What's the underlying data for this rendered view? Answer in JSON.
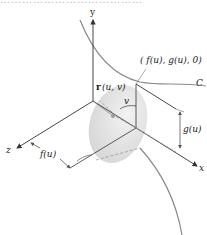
{
  "diagram": {
    "cropped_top_text": "…………………………………",
    "axes": {
      "x": "x",
      "y": "y",
      "z": "z"
    },
    "labels": {
      "point": "( f(u), g(u), 0)",
      "curve": "C",
      "r_vec": "r",
      "r_args": "(u, v)",
      "angle": "v",
      "g_dim": "g(u)",
      "f_dim": "f(u)"
    },
    "colors": {
      "line": "#333333",
      "curve": "#888888",
      "disk": "#e3e3e3",
      "dashed": "#999999"
    }
  }
}
